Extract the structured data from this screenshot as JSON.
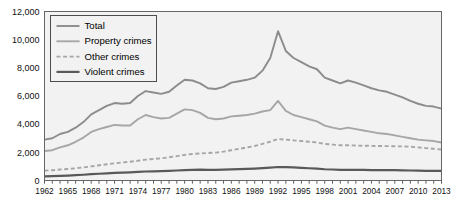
{
  "chart_data": {
    "type": "line",
    "title": "",
    "xlabel": "",
    "ylabel": "",
    "xlim": [
      1962,
      2013
    ],
    "ylim": [
      0,
      12000
    ],
    "grid": false,
    "legend_position": "top-left",
    "y_ticks": [
      "0",
      "2,000",
      "4,000",
      "6,000",
      "8,000",
      "10,000",
      "12,000"
    ],
    "y_tick_values": [
      0,
      2000,
      4000,
      6000,
      8000,
      10000,
      12000
    ],
    "x_ticks": [
      "1962",
      "1965",
      "1968",
      "1971",
      "1974",
      "1977",
      "1980",
      "1983",
      "1986",
      "1989",
      "1992",
      "1995",
      "1998",
      "2001",
      "2004",
      "2007",
      "2010",
      "2013"
    ],
    "x_tick_values": [
      1962,
      1965,
      1968,
      1971,
      1974,
      1977,
      1980,
      1983,
      1986,
      1989,
      1992,
      1995,
      1998,
      2001,
      2004,
      2007,
      2010,
      2013
    ],
    "x": [
      1962,
      1963,
      1964,
      1965,
      1966,
      1967,
      1968,
      1969,
      1970,
      1971,
      1972,
      1973,
      1974,
      1975,
      1976,
      1977,
      1978,
      1979,
      1980,
      1981,
      1982,
      1983,
      1984,
      1985,
      1986,
      1987,
      1988,
      1989,
      1990,
      1991,
      1992,
      1993,
      1994,
      1995,
      1996,
      1997,
      1998,
      1999,
      2000,
      2001,
      2002,
      2003,
      2004,
      2005,
      2006,
      2007,
      2008,
      2009,
      2010,
      2011,
      2012,
      2013
    ],
    "series": [
      {
        "name": "Total",
        "color": "#8c8c8c",
        "style": "solid",
        "width": 1.9,
        "values": [
          2900,
          3000,
          3300,
          3450,
          3750,
          4150,
          4700,
          5000,
          5300,
          5500,
          5450,
          5500,
          6000,
          6350,
          6250,
          6150,
          6300,
          6750,
          7150,
          7100,
          6900,
          6550,
          6500,
          6650,
          6950,
          7050,
          7150,
          7300,
          7800,
          8700,
          10600,
          9200,
          8700,
          8400,
          8100,
          7900,
          7300,
          7100,
          6900,
          7100,
          6950,
          6750,
          6550,
          6400,
          6300,
          6100,
          5900,
          5650,
          5450,
          5300,
          5250,
          5100
        ]
      },
      {
        "name": "Property crimes",
        "color": "#a6a6a6",
        "style": "solid",
        "width": 1.9,
        "values": [
          2100,
          2150,
          2350,
          2500,
          2750,
          3050,
          3450,
          3650,
          3800,
          3950,
          3900,
          3900,
          4350,
          4650,
          4500,
          4400,
          4450,
          4750,
          5050,
          5000,
          4800,
          4450,
          4350,
          4400,
          4550,
          4600,
          4650,
          4750,
          4900,
          5000,
          5650,
          4950,
          4650,
          4500,
          4350,
          4200,
          3900,
          3750,
          3650,
          3750,
          3650,
          3550,
          3450,
          3350,
          3300,
          3200,
          3100,
          3000,
          2900,
          2850,
          2800,
          2700
        ]
      },
      {
        "name": "Other crimes",
        "color": "#a6a6a6",
        "style": "dashed",
        "width": 1.9,
        "values": [
          700,
          730,
          780,
          820,
          870,
          930,
          1000,
          1080,
          1150,
          1220,
          1280,
          1330,
          1400,
          1480,
          1530,
          1580,
          1650,
          1730,
          1820,
          1880,
          1920,
          1950,
          1980,
          2050,
          2150,
          2250,
          2350,
          2450,
          2600,
          2750,
          2950,
          2900,
          2850,
          2800,
          2750,
          2700,
          2600,
          2550,
          2500,
          2500,
          2480,
          2470,
          2460,
          2450,
          2440,
          2430,
          2420,
          2400,
          2350,
          2300,
          2250,
          2200
        ]
      },
      {
        "name": "Violent crimes",
        "color": "#595959",
        "style": "solid",
        "width": 2.2,
        "values": [
          300,
          310,
          330,
          350,
          380,
          410,
          450,
          480,
          510,
          540,
          560,
          580,
          610,
          640,
          650,
          660,
          680,
          710,
          740,
          760,
          770,
          760,
          760,
          770,
          790,
          810,
          830,
          850,
          880,
          920,
          960,
          950,
          930,
          900,
          870,
          840,
          800,
          780,
          760,
          760,
          760,
          750,
          740,
          740,
          740,
          730,
          720,
          710,
          700,
          690,
          690,
          680
        ]
      }
    ],
    "legend_entries": [
      {
        "label": "Total",
        "color": "#8c8c8c",
        "style": "solid",
        "width": 1.9
      },
      {
        "label": "Property crimes",
        "color": "#a6a6a6",
        "style": "solid",
        "width": 1.9
      },
      {
        "label": "Other crimes",
        "color": "#a6a6a6",
        "style": "dashed",
        "width": 1.9
      },
      {
        "label": "Violent crimes",
        "color": "#595959",
        "style": "solid",
        "width": 2.2
      }
    ]
  },
  "colors": {
    "plot_background": "#f2f2f2",
    "frame": "#666666",
    "page_background": "#ffffff",
    "text": "#111111"
  }
}
